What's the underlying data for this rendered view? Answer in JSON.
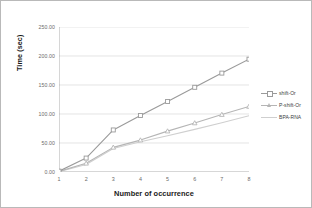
{
  "chart_data": {
    "type": "line",
    "title": "",
    "xlabel": "Number of occurrence",
    "ylabel": "Time (sec)",
    "x": [
      1,
      2,
      3,
      4,
      5,
      6,
      7,
      8
    ],
    "xtick_labels": [
      "1",
      "2",
      "3",
      "4",
      "5",
      "6",
      "7",
      "8"
    ],
    "ytick_labels": [
      "0.00",
      "50.00",
      "100.00",
      "150.00",
      "200.00",
      "250.00"
    ],
    "ytick_values": [
      0,
      50,
      100,
      150,
      200,
      250
    ],
    "ylim": [
      0,
      250
    ],
    "xlim": [
      1,
      8
    ],
    "grid": true,
    "legend_position": "right",
    "series": [
      {
        "name": "shift-Or",
        "color": "#9a9a9a",
        "marker": "square",
        "values": [
          1.5,
          24.0,
          72.5,
          97.5,
          121.5,
          146.0,
          170.5,
          194.5
        ]
      },
      {
        "name": "P-shift-Or",
        "color": "#b5b5b5",
        "marker": "triangle",
        "values": [
          1.0,
          15.0,
          42.5,
          55.0,
          70.5,
          84.5,
          99.0,
          113.0
        ]
      },
      {
        "name": "BPA-RNA",
        "color": "#cfcfcf",
        "marker": "none",
        "values": [
          0.5,
          13.0,
          40.5,
          52.0,
          62.5,
          73.5,
          85.0,
          97.0
        ]
      }
    ]
  },
  "legend": {
    "items": [
      {
        "label": "shift-Or"
      },
      {
        "label": "P-shift-Or"
      },
      {
        "label": "BPA-RNA"
      }
    ]
  },
  "axes": {
    "y_title": "Time (sec)",
    "x_title": "Number of occurrence"
  },
  "colors": {
    "grid": "#d8d8d8",
    "axis": "#9a9a9a",
    "text": "#6b6b6b",
    "frame": "#b9b9b9"
  }
}
